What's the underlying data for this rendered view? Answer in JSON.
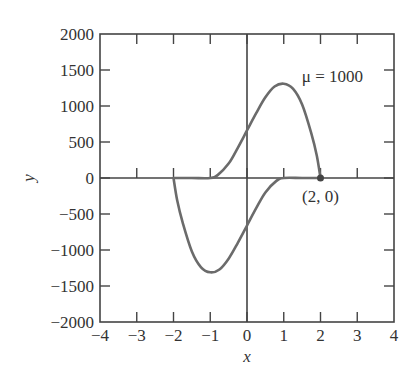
{
  "chart_data": {
    "type": "line",
    "title": "",
    "xlabel": "x",
    "ylabel": "y",
    "xlim": [
      -4,
      4
    ],
    "ylim": [
      -2000,
      2000
    ],
    "xticks": [
      -4,
      -3,
      -2,
      -1,
      0,
      1,
      2,
      3,
      4
    ],
    "xtick_labels": [
      "−4",
      "−3",
      "−2",
      "−1",
      "0",
      "1",
      "2",
      "3",
      "4"
    ],
    "yticks": [
      2000,
      1500,
      1000,
      500,
      0,
      -500,
      -1000,
      -1500,
      -2000
    ],
    "ytick_labels": [
      "2000",
      "1500",
      "1000",
      "500",
      "0",
      "−500",
      "−1000",
      "−1500",
      "−2000"
    ],
    "grid": false,
    "annotations": [
      {
        "text": "μ = 1000",
        "x": 1.6,
        "y": 1400
      },
      {
        "text": "(2, 0)",
        "x": 2,
        "y": 0,
        "marker": true
      }
    ],
    "series": [
      {
        "name": "limit cycle (upper branch)",
        "x": [
          -2.0,
          -1.5,
          -1.0,
          -0.8,
          -0.5,
          -0.25,
          0.0,
          0.25,
          0.5,
          0.75,
          1.0,
          1.25,
          1.5,
          1.75,
          1.9,
          2.0
        ],
        "y": [
          0,
          0,
          0,
          40,
          200,
          420,
          660,
          900,
          1120,
          1270,
          1310,
          1240,
          1020,
          620,
          310,
          0
        ]
      },
      {
        "name": "limit cycle (lower branch)",
        "x": [
          2.0,
          1.5,
          1.0,
          0.8,
          0.5,
          0.25,
          0.0,
          -0.25,
          -0.5,
          -0.75,
          -1.0,
          -1.25,
          -1.5,
          -1.75,
          -1.9,
          -2.0
        ],
        "y": [
          0,
          0,
          0,
          -40,
          -200,
          -420,
          -660,
          -900,
          -1120,
          -1270,
          -1310,
          -1240,
          -1020,
          -620,
          -310,
          0
        ]
      }
    ],
    "line_color": "#6b6b6b",
    "axis_color": "#444444"
  }
}
